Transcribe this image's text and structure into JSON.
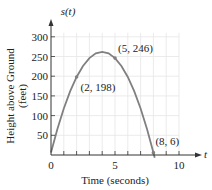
{
  "chart_data": {
    "type": "line",
    "title": "",
    "xlabel": "Time (seconds)",
    "ylabel": "Height above Ground (feet)",
    "ylabel_lines": [
      "Height above Ground",
      "(feet)"
    ],
    "x_axis_name": "t",
    "y_axis_name": "s(t)",
    "xlim": [
      0,
      10
    ],
    "ylim": [
      0,
      300
    ],
    "x_ticks": [
      0,
      5,
      10
    ],
    "x_tick_labels": [
      "0",
      "5",
      "10"
    ],
    "x_minor_step": 1,
    "y_ticks": [
      50,
      100,
      150,
      200,
      250,
      300
    ],
    "y_tick_labels": [
      "50",
      "100",
      "150",
      "200",
      "250",
      "300"
    ],
    "grid": true,
    "series": [
      {
        "name": "s(t)",
        "x": [
          0,
          0.5,
          1,
          1.5,
          2,
          2.5,
          3,
          3.5,
          4,
          4.5,
          5,
          5.5,
          6,
          6.5,
          7,
          7.5,
          8,
          8.1
        ],
        "values": [
          6,
          66,
          118,
          162,
          198,
          226,
          246,
          258,
          262,
          258,
          246,
          226,
          198,
          162,
          118,
          66,
          6,
          -7
        ]
      }
    ],
    "annotations": [
      {
        "label": "(2, 198)",
        "x": 2,
        "y": 198
      },
      {
        "label": "(5, 246)",
        "x": 5,
        "y": 246
      },
      {
        "label": "(8, 6)",
        "x": 8,
        "y": 6
      }
    ],
    "colors": {
      "curve": "#808080",
      "axis": "#333333",
      "grid": "#e6e6e6"
    }
  }
}
